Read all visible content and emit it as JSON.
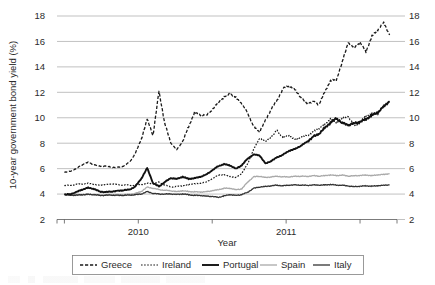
{
  "chart_data": {
    "type": "line",
    "title": "",
    "xlabel": "Year",
    "ylabel": "10-year government bond yield (%)",
    "ylim": [
      2,
      18
    ],
    "ytick_step": 2,
    "yticks": [
      2,
      4,
      6,
      8,
      10,
      12,
      14,
      16,
      18
    ],
    "ytick_labels": [
      "2",
      "4",
      "6",
      "8",
      "10",
      "12",
      "14",
      "16",
      "18"
    ],
    "right_axis_mirrored": true,
    "right_ytick_labels": [
      "2",
      "4",
      "6",
      "8",
      "10",
      "12",
      "14",
      "16",
      "18"
    ],
    "xlim": [
      2009.45,
      2011.75
    ],
    "xtick_labels": [
      "2010",
      "2011"
    ],
    "xtick_values": [
      2010,
      2011
    ],
    "xtick_label_positions": [
      2010,
      2011
    ],
    "minor_xticks": [
      2009.5,
      2010.0,
      2010.5,
      2011.0,
      2011.5
    ],
    "grid": "horizontal",
    "legend_position": "bottom",
    "legend_entries": [
      {
        "name": "Greece",
        "style": "dashed",
        "color": "#1a1a1a",
        "width": 1.3
      },
      {
        "name": "Ireland",
        "style": "dotted",
        "color": "#1a1a1a",
        "width": 1.2
      },
      {
        "name": "Portugal",
        "style": "solid",
        "color": "#111111",
        "width": 1.9
      },
      {
        "name": "Spain",
        "style": "solid",
        "color": "#a9a9a9",
        "width": 1.3
      },
      {
        "name": "Italy",
        "style": "solid",
        "color": "#333333",
        "width": 1.3
      }
    ],
    "x": [
      2009.5,
      2009.54,
      2009.58,
      2009.62,
      2009.66,
      2009.7,
      2009.74,
      2009.78,
      2009.82,
      2009.86,
      2009.9,
      2009.94,
      2009.98,
      2010.02,
      2010.06,
      2010.1,
      2010.14,
      2010.18,
      2010.22,
      2010.26,
      2010.3,
      2010.34,
      2010.38,
      2010.42,
      2010.46,
      2010.5,
      2010.54,
      2010.58,
      2010.62,
      2010.66,
      2010.7,
      2010.74,
      2010.78,
      2010.82,
      2010.86,
      2010.9,
      2010.94,
      2010.98,
      2011.02,
      2011.06,
      2011.1,
      2011.14,
      2011.18,
      2011.22,
      2011.26,
      2011.3,
      2011.34,
      2011.38,
      2011.42,
      2011.46,
      2011.5,
      2011.54,
      2011.58,
      2011.62,
      2011.66,
      2011.7
    ],
    "series": [
      {
        "name": "Greece",
        "style": "dashed",
        "color": "#1a1a1a",
        "values": [
          5.7,
          5.8,
          6.0,
          6.3,
          6.5,
          6.3,
          6.2,
          6.2,
          6.1,
          6.1,
          6.2,
          6.5,
          7.2,
          8.3,
          9.9,
          8.6,
          12.1,
          9.5,
          8.0,
          7.5,
          8.1,
          9.3,
          10.4,
          10.2,
          10.2,
          10.6,
          11.2,
          11.6,
          11.9,
          11.6,
          11.1,
          10.4,
          9.3,
          8.9,
          9.8,
          10.7,
          11.4,
          12.3,
          12.5,
          12.2,
          11.6,
          11.1,
          11.3,
          11.0,
          12.0,
          12.9,
          13.0,
          14.4,
          15.9,
          15.5,
          15.9,
          15.2,
          16.4,
          16.9,
          17.5,
          16.5
        ]
      },
      {
        "name": "Ireland",
        "style": "dotted",
        "color": "#1a1a1a",
        "values": [
          4.65,
          4.7,
          4.75,
          4.8,
          4.85,
          4.75,
          4.7,
          4.75,
          4.8,
          4.75,
          4.7,
          4.7,
          4.7,
          4.75,
          4.85,
          4.8,
          4.95,
          4.7,
          4.55,
          4.6,
          4.65,
          4.75,
          4.8,
          4.85,
          4.95,
          5.2,
          5.5,
          5.5,
          5.4,
          5.3,
          5.6,
          6.4,
          7.5,
          8.4,
          8.1,
          8.5,
          9.0,
          8.4,
          8.6,
          8.3,
          8.5,
          8.6,
          8.9,
          9.1,
          9.5,
          9.9,
          9.6,
          10.0,
          10.1,
          9.4,
          9.6,
          10.2,
          10.3,
          10.3,
          11.0,
          11.3
        ]
      },
      {
        "name": "Portugal",
        "style": "solid",
        "color": "#111111",
        "values": [
          3.95,
          4.0,
          4.15,
          4.35,
          4.5,
          4.4,
          4.2,
          4.15,
          4.2,
          4.25,
          4.3,
          4.35,
          4.6,
          5.2,
          6.05,
          4.85,
          4.6,
          4.95,
          5.25,
          5.2,
          5.35,
          5.2,
          5.25,
          5.35,
          5.55,
          5.85,
          6.2,
          6.35,
          6.25,
          6.0,
          6.25,
          6.8,
          7.1,
          7.05,
          6.4,
          6.6,
          6.9,
          7.1,
          7.4,
          7.55,
          7.8,
          8.1,
          8.5,
          8.7,
          9.2,
          9.6,
          9.95,
          9.6,
          9.4,
          9.6,
          9.65,
          9.9,
          10.2,
          10.4,
          10.9,
          11.3
        ]
      },
      {
        "name": "Spain",
        "style": "solid",
        "color": "#a9a9a9",
        "values": [
          3.95,
          3.95,
          3.95,
          3.95,
          3.98,
          3.95,
          3.92,
          3.92,
          3.95,
          3.95,
          3.95,
          3.98,
          4.05,
          4.2,
          4.55,
          4.45,
          4.35,
          4.3,
          4.25,
          4.2,
          4.25,
          4.2,
          4.18,
          4.15,
          4.2,
          4.25,
          4.35,
          4.45,
          4.45,
          4.35,
          4.4,
          4.95,
          5.35,
          5.4,
          5.3,
          5.35,
          5.4,
          5.35,
          5.35,
          5.4,
          5.4,
          5.38,
          5.45,
          5.4,
          5.45,
          5.5,
          5.45,
          5.5,
          5.4,
          5.45,
          5.45,
          5.5,
          5.45,
          5.5,
          5.55,
          5.6
        ]
      },
      {
        "name": "Italy",
        "style": "solid",
        "color": "#333333",
        "values": [
          3.95,
          3.92,
          3.9,
          3.95,
          3.98,
          3.95,
          3.9,
          3.9,
          3.92,
          3.9,
          3.9,
          3.92,
          3.95,
          4.0,
          4.2,
          4.05,
          4.0,
          4.0,
          4.0,
          3.98,
          4.0,
          3.95,
          3.9,
          3.88,
          3.85,
          3.8,
          3.75,
          3.85,
          3.95,
          3.9,
          3.95,
          4.15,
          4.45,
          4.55,
          4.6,
          4.65,
          4.7,
          4.65,
          4.7,
          4.72,
          4.7,
          4.68,
          4.72,
          4.7,
          4.72,
          4.75,
          4.7,
          4.7,
          4.62,
          4.6,
          4.6,
          4.65,
          4.62,
          4.65,
          4.7,
          4.72
        ]
      }
    ]
  },
  "axis": {
    "y_title": "10-year government bond yield (%)",
    "x_title": "Year",
    "left_ticks": [
      "18",
      "16",
      "14",
      "12",
      "10",
      "8",
      "6",
      "4",
      "2"
    ],
    "right_ticks": [
      "18",
      "16",
      "14",
      "12",
      "10",
      "8",
      "6",
      "4",
      "2"
    ],
    "x_labels": [
      "2010",
      "2011"
    ]
  },
  "legend": {
    "items": [
      "Greece",
      "Ireland",
      "Portugal",
      "Spain",
      "Italy"
    ]
  }
}
